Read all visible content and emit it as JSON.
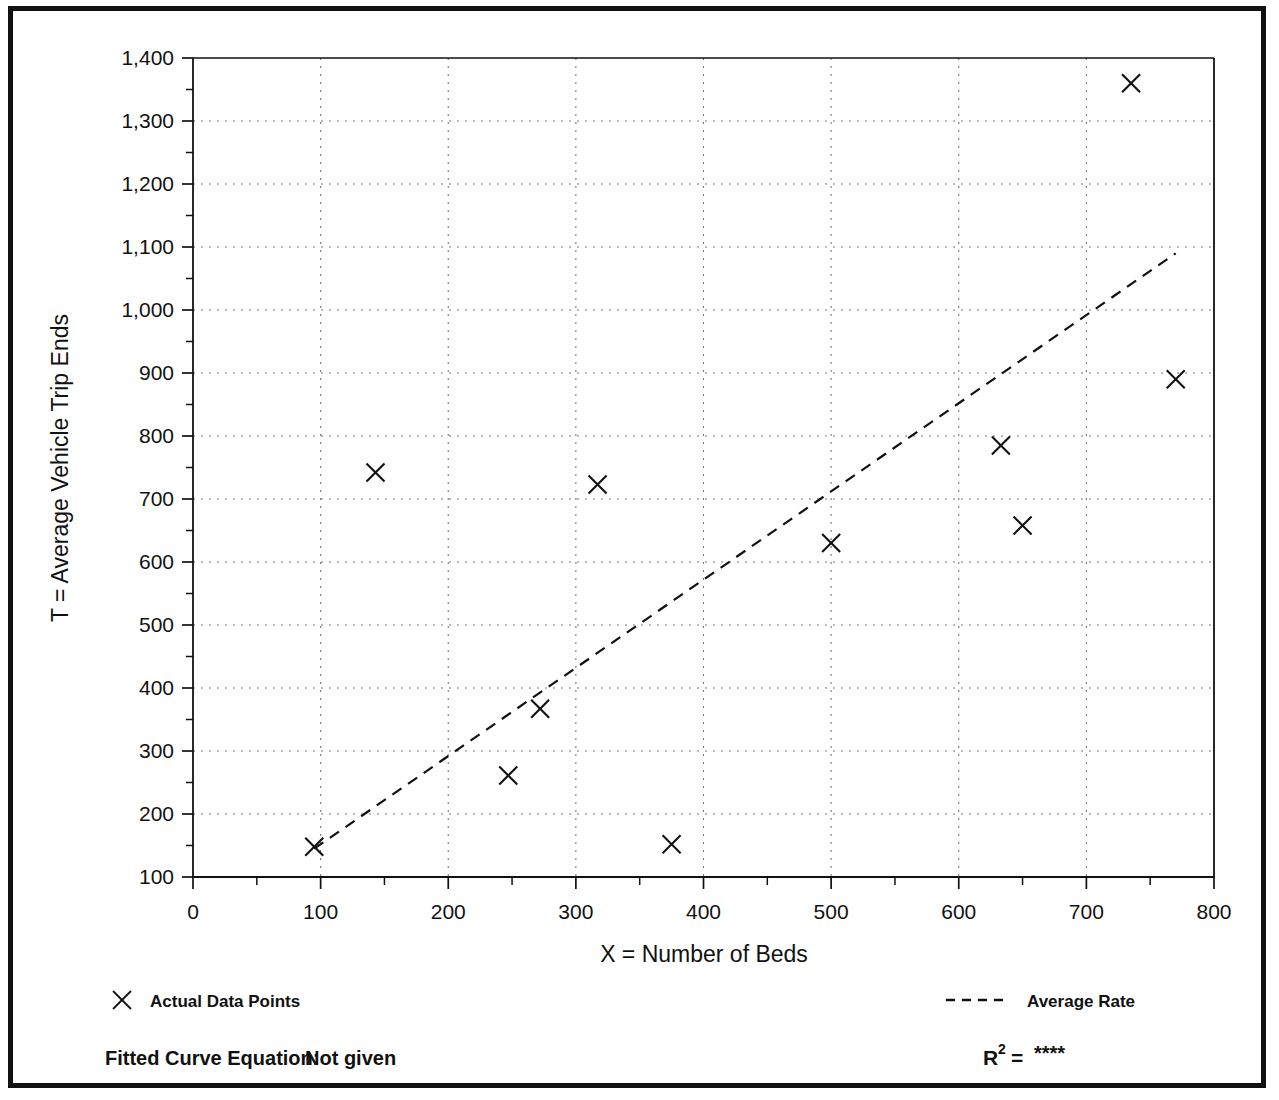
{
  "chart_data": {
    "type": "scatter",
    "title": "",
    "xlabel": "X = Number of Beds",
    "ylabel": "T = Average Vehicle Trip Ends",
    "xlim": [
      0,
      800
    ],
    "ylim": [
      100,
      1400
    ],
    "x_ticks": [
      0,
      100,
      200,
      300,
      400,
      500,
      600,
      700,
      800
    ],
    "y_ticks": [
      100,
      200,
      300,
      400,
      500,
      600,
      700,
      800,
      900,
      1000,
      1100,
      1200,
      1300,
      1400
    ],
    "x_tick_labels": [
      "0",
      "100",
      "200",
      "300",
      "400",
      "500",
      "600",
      "700",
      "800"
    ],
    "y_tick_labels": [
      "100",
      "200",
      "300",
      "400",
      "500",
      "600",
      "700",
      "800",
      "900",
      "1,000",
      "1,100",
      "1,200",
      "1,300",
      "1,400"
    ],
    "x_minor_tick_step": 50,
    "y_minor_tick_step": 50,
    "grid": true,
    "grid_style": "dotted",
    "legend_position": "below-axes",
    "series": [
      {
        "name": "Actual Data Points",
        "type": "scatter",
        "marker": "x",
        "points": [
          {
            "x": 95,
            "y": 148
          },
          {
            "x": 143,
            "y": 742
          },
          {
            "x": 247,
            "y": 261
          },
          {
            "x": 272,
            "y": 367
          },
          {
            "x": 317,
            "y": 723
          },
          {
            "x": 375,
            "y": 152
          },
          {
            "x": 500,
            "y": 630
          },
          {
            "x": 633,
            "y": 785
          },
          {
            "x": 650,
            "y": 658
          },
          {
            "x": 735,
            "y": 1360
          },
          {
            "x": 770,
            "y": 890
          }
        ]
      },
      {
        "name": "Average Rate",
        "type": "line",
        "style": "dashed",
        "endpoints": [
          {
            "x": 95,
            "y": 145
          },
          {
            "x": 770,
            "y": 1090
          }
        ]
      }
    ]
  },
  "legend": {
    "data_points_label": "Actual Data Points",
    "average_rate_label": "Average Rate",
    "marker_glyph": "x-marker-icon",
    "line_glyph": "dashed-line-icon"
  },
  "footer": {
    "equation_label": "Fitted Curve Equation:",
    "equation_value": "Not given",
    "r2_label": "R",
    "r2_exponent": "2",
    "r2_equals": "=",
    "r2_value": "****"
  },
  "colors": {
    "ink": "#111111",
    "grid": "#777777",
    "border": "#111111",
    "background": "#ffffff"
  }
}
